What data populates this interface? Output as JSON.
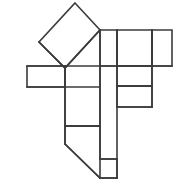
{
  "figure": {
    "title": "",
    "type": "line-drawing",
    "canvas": {
      "width": 187,
      "height": 195,
      "background": "#ffffff"
    },
    "stroke": {
      "color": "#3b3b3b",
      "width": 1.6
    },
    "grid_unit": 35,
    "faces": [
      {
        "name": "rotated-square",
        "shape": "diamond",
        "points": "75,3 100,30 65,68 39,42"
      },
      {
        "name": "left-wing-square",
        "shape": "rectangle",
        "points": "27,66 65,66 65,87 27,87"
      },
      {
        "name": "center-square",
        "shape": "rectangle",
        "points": "65,66 100,66 100,126 65,126"
      },
      {
        "name": "top-right-square-a",
        "shape": "rectangle",
        "points": "100,30 117,30 117,66 100,66"
      },
      {
        "name": "top-right-square-b",
        "shape": "rectangle",
        "points": "117,30 152,30 152,66 117,66"
      },
      {
        "name": "top-right-square-c",
        "shape": "rectangle",
        "points": "152,30 172,30 172,66 152,66"
      },
      {
        "name": "mid-right-square-upper",
        "shape": "rectangle",
        "points": "117,66 152,66 152,86 117,86"
      },
      {
        "name": "mid-right-square-lower",
        "shape": "rectangle",
        "points": "117,86 152,86 152,107 117,107"
      },
      {
        "name": "bottom-tail",
        "shape": "polygon",
        "points": "65,126 100,126 100,159 117,159 117,178 100,178 65,144"
      }
    ],
    "outline_path": "M 75,3 L 100,30 L 117,30 L 172,30 L 172,66 L 152,66 L 152,107 L 117,107 L 117,159 L 117,178 L 100,178 L 65,144 L 65,126 L 65,87 L 27,87 L 27,66 L 65,66 L 39,42 Z",
    "interior_segments": [
      {
        "name": "diamond-lower-left-edge",
        "d": "M 39,42 L 65,68"
      },
      {
        "name": "diamond-lower-right-edge",
        "d": "M 100,30 L 65,68"
      },
      {
        "name": "left-wing-top",
        "d": "M 27,66 L 65,66"
      },
      {
        "name": "left-wing-bottom",
        "d": "M 27,87 L 100,87"
      },
      {
        "name": "center-vertical-left",
        "d": "M 65,66 L 65,144"
      },
      {
        "name": "center-vertical-right",
        "d": "M 100,30 L 100,178"
      },
      {
        "name": "center-bottom-divider",
        "d": "M 65,126 L 100,126"
      },
      {
        "name": "right-vertical-a",
        "d": "M 117,30 L 117,178"
      },
      {
        "name": "right-vertical-b",
        "d": "M 152,30 L 152,107"
      },
      {
        "name": "right-horizontal-mid",
        "d": "M 100,66 L 172,66"
      },
      {
        "name": "right-horizontal-lower",
        "d": "M 117,86 L 152,86"
      },
      {
        "name": "right-horizontal-bottom",
        "d": "M 117,107 L 152,107"
      },
      {
        "name": "tail-diagonal",
        "d": "M 65,144 L 100,178"
      },
      {
        "name": "tail-notch-top",
        "d": "M 100,159 L 117,159"
      },
      {
        "name": "tail-notch-bottom",
        "d": "M 100,178 L 117,178"
      }
    ]
  }
}
